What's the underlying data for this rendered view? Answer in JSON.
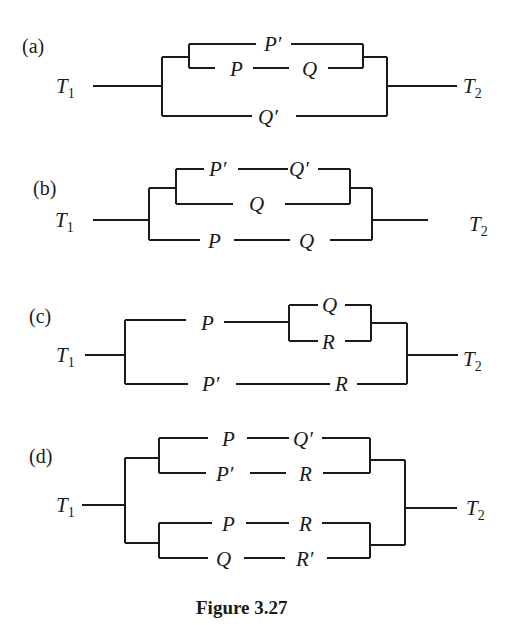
{
  "caption": "Figure 3.27",
  "terminals": {
    "left": "T",
    "left_sub": "1",
    "right": "T",
    "right_sub": "2"
  },
  "circuits": [
    {
      "id": "a",
      "label": "(a)",
      "structure": "parallel( parallel( P', series(P, Q) ), Q' )",
      "switches": {
        "top": "P′",
        "mid_left": "P",
        "mid_right": "Q",
        "bottom": "Q′"
      }
    },
    {
      "id": "b",
      "label": "(b)",
      "structure": "parallel( parallel( series(P', Q'), Q ), series(P, Q) )",
      "switches": {
        "top_left": "P′",
        "top_right": "Q′",
        "mid": "Q",
        "bottom_left": "P",
        "bottom_right": "Q"
      }
    },
    {
      "id": "c",
      "label": "(c)",
      "structure": "parallel( series(P, parallel(Q, R)), series(P', R) )",
      "switches": {
        "top_left": "P",
        "inner_top": "Q",
        "inner_bottom": "R",
        "bottom_left": "P′",
        "bottom_right": "R"
      }
    },
    {
      "id": "d",
      "label": "(d)",
      "structure": "parallel( parallel( series(P, Q'), series(P', R) ), parallel( series(P, R), series(Q, R') ) )",
      "switches": {
        "g1_top_left": "P",
        "g1_top_right": "Q′",
        "g1_bot_left": "P′",
        "g1_bot_right": "R",
        "g2_top_left": "P",
        "g2_top_right": "R",
        "g2_bot_left": "Q",
        "g2_bot_right": "R′"
      }
    }
  ]
}
